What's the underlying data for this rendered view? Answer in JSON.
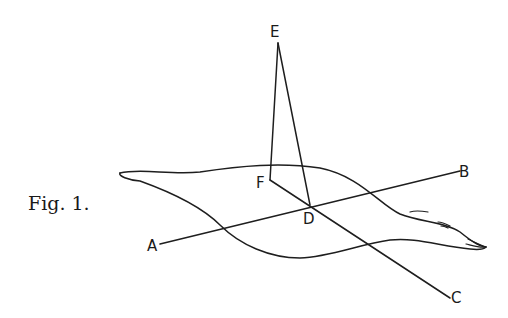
{
  "figure": {
    "caption": "Fig. 1.",
    "labels": {
      "A": "A",
      "B": "B",
      "C": "C",
      "D": "D",
      "E": "E",
      "F": "F"
    }
  }
}
